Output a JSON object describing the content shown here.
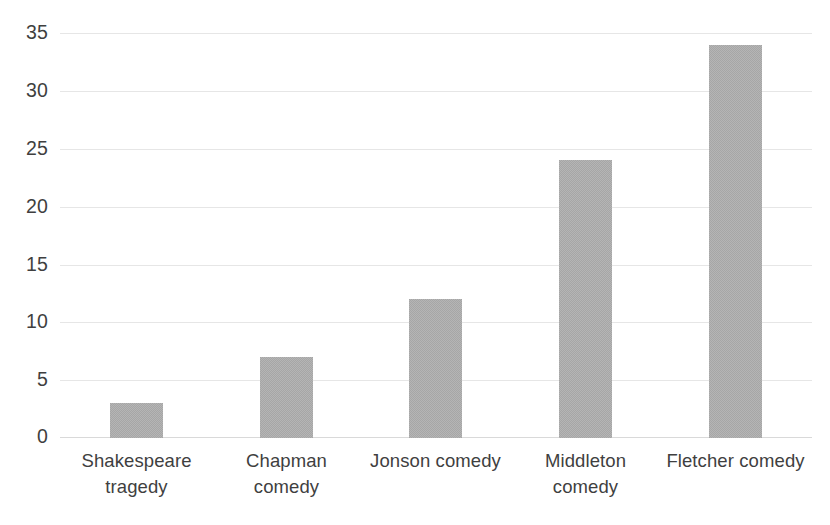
{
  "chart_data": {
    "type": "bar",
    "title": "",
    "subtitle": "",
    "xlabel": "",
    "ylabel": "",
    "categories": [
      "Shakespeare tragedy",
      "Chapman comedy",
      "Jonson comedy",
      "Middleton comedy",
      "Fletcher comedy"
    ],
    "category_lines": [
      [
        "Shakespeare",
        "tragedy"
      ],
      [
        "Chapman",
        "comedy"
      ],
      [
        "Jonson comedy"
      ],
      [
        "Middleton",
        "comedy"
      ],
      [
        "Fletcher comedy"
      ]
    ],
    "values": [
      3,
      7,
      12,
      24,
      34
    ],
    "ylim": [
      0,
      35
    ],
    "ytick_values": [
      0,
      5,
      10,
      15,
      20,
      25,
      30,
      35
    ],
    "ytick_labels": [
      "0",
      "5",
      "10",
      "15",
      "20",
      "25",
      "30",
      "35"
    ],
    "grid": {
      "horizontal": true,
      "vertical": false,
      "color": "#e6e6e6"
    },
    "legend": {
      "visible": false,
      "entries": []
    },
    "annotations": [],
    "colors": {
      "bar_fill": "#a6a6a6",
      "text": "#3f3f3f",
      "gridline": "#e6e6e6",
      "axis": "#d9d9d9",
      "background": "#ffffff"
    }
  }
}
